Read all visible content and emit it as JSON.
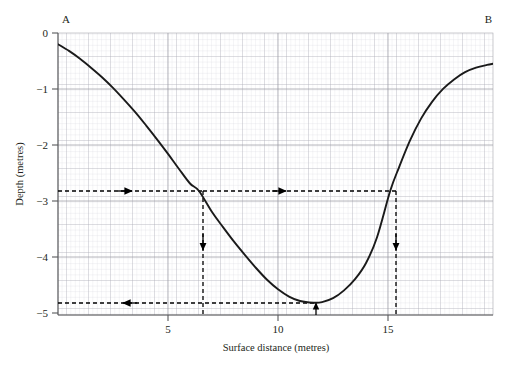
{
  "chart_data": {
    "type": "line",
    "title": "",
    "xlabel": "Surface distance (metres)",
    "ylabel": "Depth (metres)",
    "xlim": [
      0,
      19.77
    ],
    "ylim": [
      -5.04,
      0
    ],
    "xticks": [
      5,
      10,
      15
    ],
    "xtick_labels": [
      "5",
      "10",
      "15"
    ],
    "yticks": [
      0,
      -1,
      -2,
      -3,
      -4,
      -5
    ],
    "ytick_labels": [
      "0",
      "−1",
      "−2",
      "−3",
      "−4",
      "−5"
    ],
    "grid": "minor and major grid shown",
    "legend": "none",
    "series": [
      {
        "name": "Riverbed cross-section profile",
        "x": [
          0.0,
          0.5,
          1.0,
          1.5,
          2.0,
          2.5,
          3.0,
          3.5,
          4.0,
          4.5,
          5.0,
          5.5,
          6.0,
          6.4,
          7.0,
          7.5,
          8.0,
          8.5,
          9.0,
          9.5,
          10.0,
          10.5,
          11.0,
          11.6,
          12.0,
          12.5,
          13.0,
          13.5,
          14.0,
          14.5,
          15.1,
          15.5,
          16.0,
          16.5,
          17.0,
          17.5,
          18.0,
          18.5,
          19.0,
          19.5,
          19.77
        ],
        "y": [
          -0.2,
          -0.32,
          -0.46,
          -0.62,
          -0.79,
          -0.98,
          -1.19,
          -1.41,
          -1.65,
          -1.9,
          -2.16,
          -2.43,
          -2.69,
          -2.82,
          -3.2,
          -3.47,
          -3.73,
          -3.97,
          -4.2,
          -4.41,
          -4.58,
          -4.71,
          -4.79,
          -4.82,
          -4.81,
          -4.74,
          -4.6,
          -4.4,
          -4.11,
          -3.65,
          -2.82,
          -2.4,
          -1.92,
          -1.53,
          -1.23,
          -1.0,
          -0.83,
          -0.7,
          -0.62,
          -0.57,
          -0.55
        ]
      }
    ],
    "annotations": {
      "endpoint_left_label": "A",
      "endpoint_right_label": "B",
      "construction_lines": [
        {
          "name": "depth-2.8-horizontal-left",
          "type": "horizontal-dashed-arrow",
          "y_value": -2.82,
          "x_from": 0,
          "x_to": 6.4,
          "arrow_at": "right",
          "arrow_x": 4.0
        },
        {
          "name": "depth-2.8-horizontal-right",
          "type": "horizontal-dashed-arrow",
          "y_value": -2.82,
          "x_from": 6.4,
          "x_to": 15.1,
          "arrow_at": "right",
          "arrow_x": 11.0
        },
        {
          "name": "x-6.4-vertical",
          "type": "vertical-dashed-arrow",
          "x_value": 6.4,
          "y_from": -2.82,
          "y_to": -5.04,
          "arrow_at": "down",
          "arrow_y": -3.85
        },
        {
          "name": "x-15.1-vertical",
          "type": "vertical-dashed-arrow",
          "x_value": 15.1,
          "y_from": -2.82,
          "y_to": -5.04,
          "arrow_at": "down",
          "arrow_y": -3.85
        },
        {
          "name": "minimum-depth-horizontal",
          "type": "horizontal-dashed-arrow",
          "y_value": -4.82,
          "x_from": 0,
          "x_to": 11.6,
          "arrow_at": "left",
          "arrow_x": 4.2
        },
        {
          "name": "minimum-point-marker",
          "type": "vertical-up-arrow",
          "x_value": 11.6,
          "y_from": -5.04,
          "y_to": -4.82
        }
      ]
    },
    "colors": {
      "curve": "#1a1a1a",
      "axis": "#58595b",
      "major_grid": "#9a9aa0",
      "minor_grid": "#cfcfd6",
      "dashed": "#000000",
      "text": "#231f20",
      "background": "#ffffff"
    }
  },
  "axes": {
    "x_title": "Surface distance (metres)",
    "y_title": "Depth (metres)",
    "x_tick_labels": [
      "5",
      "10",
      "15"
    ],
    "y_tick_labels": [
      "0",
      "−1",
      "−2",
      "−3",
      "−4",
      "−5"
    ]
  },
  "labels": {
    "point_a": "A",
    "point_b": "B"
  }
}
